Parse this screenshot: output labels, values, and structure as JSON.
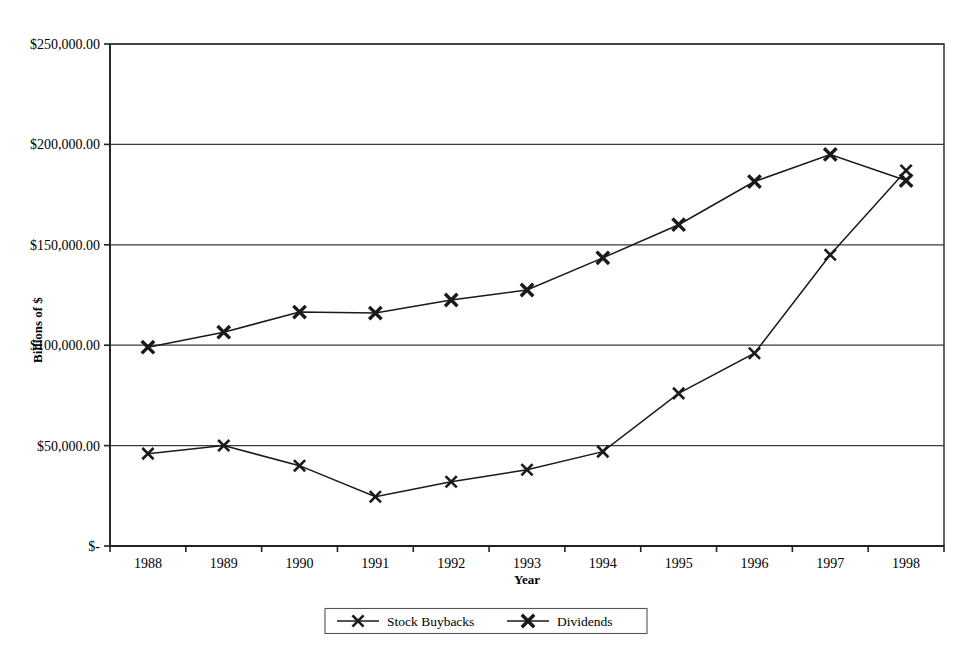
{
  "chart_data": {
    "type": "line",
    "title": "",
    "xlabel": "Year",
    "ylabel": "Billions of $",
    "categories": [
      "1988",
      "1989",
      "1990",
      "1991",
      "1992",
      "1993",
      "1994",
      "1995",
      "1996",
      "1997",
      "1998"
    ],
    "x": [
      1988,
      1989,
      1990,
      1991,
      1992,
      1993,
      1994,
      1995,
      1996,
      1997,
      1998
    ],
    "series": [
      {
        "name": "Stock Buybacks",
        "marker": "x",
        "values": [
          46000,
          50000,
          40000,
          24500,
          32000,
          38000,
          47000,
          76000,
          96000,
          145000,
          187000
        ]
      },
      {
        "name": "Dividends",
        "marker": "x",
        "values": [
          99000,
          106500,
          116500,
          116000,
          122500,
          127500,
          143500,
          160000,
          181500,
          195000,
          182000
        ]
      }
    ],
    "ylim": [
      0,
      250000
    ],
    "ytick_values": [
      0,
      50000,
      100000,
      150000,
      200000,
      250000
    ],
    "ytick_labels": [
      "$-",
      "$50,000.00",
      "$100,000.00",
      "$150,000.00",
      "$200,000.00",
      "$250,000.00"
    ],
    "grid": "horizontal",
    "legend_position": "bottom",
    "legend_entries": [
      "Stock Buybacks",
      "Dividends"
    ],
    "colors": {
      "line": "#1a1a1a",
      "grid": "#3b3b3b",
      "background": "#ffffff"
    }
  }
}
